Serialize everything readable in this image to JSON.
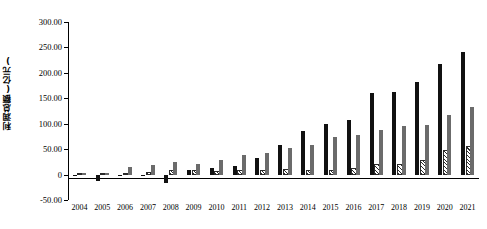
{
  "chart_data": {
    "type": "bar",
    "title": "",
    "subtitle": "",
    "xlabel": "",
    "ylabel": "利润总额(亿元)",
    "ylim": [
      -50,
      300
    ],
    "ytick_values": [
      300,
      250,
      200,
      150,
      100,
      50,
      0,
      -50
    ],
    "ytick_labels": [
      "300.00",
      "250.00",
      "200.00",
      "150.00",
      "100.00",
      "50.00",
      "0",
      "-50.00"
    ],
    "grid": false,
    "legend_position": "none",
    "categories": [
      "2004",
      "2005",
      "2006",
      "2007",
      "2008",
      "2009",
      "2010",
      "2011",
      "2012",
      "2013",
      "2014",
      "2015",
      "2016",
      "2017",
      "2018",
      "2019",
      "2020",
      "2021"
    ],
    "series": [
      {
        "name": "series-black",
        "style": "solid-black",
        "color": "#111111",
        "values": [
          -3.0,
          -13.0,
          -2.0,
          -2.0,
          -17.0,
          8.5,
          13.0,
          16.0,
          32.0,
          59.0,
          85.0,
          99.0,
          108.0,
          160.0,
          162.0,
          182.0,
          218.0,
          242.0
        ]
      },
      {
        "name": "series-hatched",
        "style": "diagonal-hatch",
        "color": "#ffffff",
        "values": [
          0.0,
          0.0,
          0.0,
          1.5,
          5.0,
          4.5,
          4.0,
          6.0,
          6.0,
          7.0,
          6.0,
          6.0,
          9.0,
          16.0,
          17.0,
          25.0,
          45.0,
          53.0
        ]
      },
      {
        "name": "series-gray",
        "style": "solid-gray",
        "color": "#6b6b6b",
        "values": [
          4.0,
          3.5,
          14.0,
          18.0,
          25.0,
          21.0,
          28.0,
          38.0,
          43.0,
          52.0,
          58.0,
          74.0,
          78.0,
          88.0,
          96.0,
          98.0,
          118.0,
          133.0
        ]
      }
    ]
  },
  "axis": {
    "y_title": "利润总额(亿元)"
  }
}
